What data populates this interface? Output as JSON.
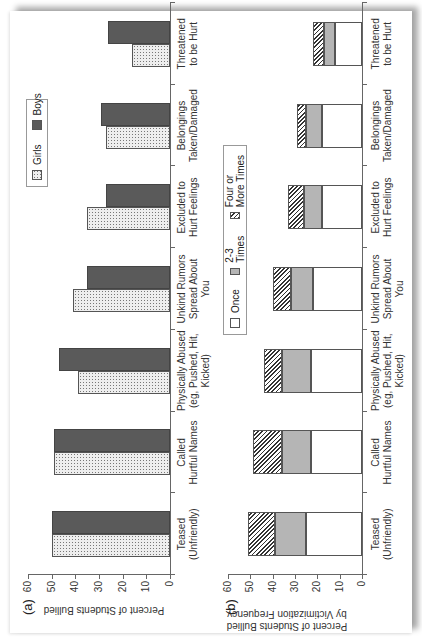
{
  "chart_data": [
    {
      "panel": "(a)",
      "type": "bar",
      "title": "",
      "xlabel": "",
      "ylabel": "Percent of Students Bullied",
      "ylim": [
        0,
        60
      ],
      "yticks": [
        0,
        10,
        20,
        30,
        40,
        50,
        60
      ],
      "grid": false,
      "legend_position": "top-right",
      "categories": [
        "Teased (Unfriendly)",
        "Called Hurtful Names",
        "Physically Abused (eg, Pushed, Hit, Kicked)",
        "Unkind Rumors Spread About You",
        "Excluded to Hurt Feelings",
        "Belongings Taken/Damaged",
        "Threatened to be Hurt"
      ],
      "series": [
        {
          "name": "Girls",
          "values": [
            50,
            49,
            39,
            41,
            35,
            27,
            16
          ]
        },
        {
          "name": "Boys",
          "values": [
            50,
            49,
            47,
            35,
            27,
            29,
            26
          ]
        }
      ]
    },
    {
      "panel": "(b)",
      "type": "bar",
      "stacked": true,
      "title": "",
      "xlabel": "",
      "ylabel": "Percent of Students Bullied by Victimization Frequency",
      "ylim": [
        0,
        60
      ],
      "yticks": [
        0,
        10,
        20,
        30,
        40,
        50,
        60
      ],
      "grid": false,
      "legend_position": "top",
      "categories": [
        "Teased (Unfriendly)",
        "Called Hurtful Names",
        "Physically Abused (eg, Pushed, Hit, Kicked)",
        "Unkind Rumors Spread About You",
        "Excluded to Hurt Feelings",
        "Belongings Taken/Damaged",
        "Threatened to be Hurt"
      ],
      "series": [
        {
          "name": "Once",
          "values": [
            25,
            23,
            23,
            22,
            18,
            18,
            12
          ]
        },
        {
          "name": "2-3 Times",
          "values": [
            14,
            13,
            13,
            10,
            8,
            7,
            5
          ]
        },
        {
          "name": "Four or More Times",
          "values": [
            12,
            13,
            8,
            8,
            7,
            4,
            5
          ]
        }
      ]
    }
  ],
  "panel_a": {
    "label": "(a)",
    "ylabel": "Percent of Students Bullied",
    "legend": [
      {
        "name": "Girls",
        "style": "dotted"
      },
      {
        "name": "Boys",
        "style": "dark"
      }
    ]
  },
  "panel_b": {
    "label": "(b)",
    "ylabel_line1": "Percent of Students Bullied",
    "ylabel_line2": "by Victimization Frequency",
    "legend": [
      {
        "name": "Once",
        "style": "white"
      },
      {
        "name": "2-3 Times",
        "style": "gray"
      },
      {
        "name": "Four or More Times",
        "style": "hatched"
      }
    ]
  },
  "ticks": [
    "60",
    "50",
    "40",
    "30",
    "20",
    "10",
    "0"
  ],
  "category_labels": [
    [
      "Teased",
      "(Unfriendly)",
      ""
    ],
    [
      "Called",
      "Hurtful Names",
      ""
    ],
    [
      "Physically Abused",
      "(eg, Pushed, Hit,",
      "Kicked)"
    ],
    [
      "Unkind Rumors",
      "Spread About",
      "You"
    ],
    [
      "Excluded to",
      "Hurt Feelings",
      ""
    ],
    [
      "Belongings",
      "Taken/Damaged",
      ""
    ],
    [
      "Threatened",
      "to be Hurt",
      ""
    ]
  ],
  "colors": {
    "boys": "#5a5a5a",
    "girls_dots": "#777777",
    "two_three": "#b5b5b5",
    "hatch": "#333333"
  }
}
